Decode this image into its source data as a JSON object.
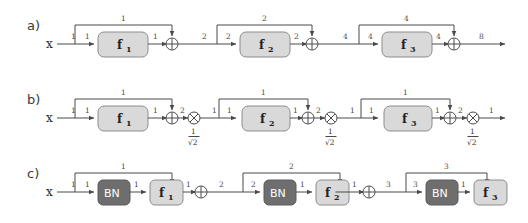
{
  "figure": {
    "background": "#ffffff",
    "colors": {
      "wire": "#4a4a4a",
      "f_block_fill": "#d9d9d9",
      "f_block_stroke": "#8d8d8d",
      "bn_block_fill": "#6e6e6e",
      "bn_block_text": "#ffffff",
      "text": "#333333"
    },
    "rows": [
      {
        "id": "row-a",
        "label": "a)",
        "input_label": "x",
        "description": "plain residual chain, variance doubling",
        "blocks": [
          {
            "name": "f",
            "sub": "1"
          },
          {
            "name": "f",
            "sub": "2"
          },
          {
            "name": "f",
            "sub": "3"
          }
        ],
        "operators": [
          "plus",
          "plus",
          "plus"
        ],
        "edge_labels": {
          "input": "1",
          "stage1": {
            "branch_in": "1",
            "skip": "1",
            "block_out": "1",
            "sum_out": "2"
          },
          "stage2": {
            "branch_in": "2",
            "skip": "2",
            "block_out": "2",
            "sum_out": "4"
          },
          "stage3": {
            "branch_in": "4",
            "skip": "4",
            "block_out": "4",
            "sum_out": "8"
          }
        }
      },
      {
        "id": "row-b",
        "label": "b)",
        "input_label": "x",
        "description": "residual chain with 1/sqrt(2) rescaling after each sum",
        "blocks": [
          {
            "name": "f",
            "sub": "1"
          },
          {
            "name": "f",
            "sub": "2"
          },
          {
            "name": "f",
            "sub": "3"
          }
        ],
        "operators": [
          "plus",
          "times",
          "plus",
          "times",
          "plus",
          "times"
        ],
        "scale_numerator": "1",
        "scale_denominator": "√2",
        "edge_labels": {
          "input": "1",
          "stage1": {
            "branch_in": "1",
            "skip": "1",
            "block_out": "1",
            "sum_out": "2",
            "scaled_out": "1"
          },
          "stage2": {
            "branch_in": "1",
            "skip": "1",
            "block_out": "1",
            "sum_out": "2",
            "scaled_out": "1"
          },
          "stage3": {
            "branch_in": "1",
            "skip": "1",
            "block_out": "1",
            "sum_out": "2",
            "scaled_out": "1"
          }
        }
      },
      {
        "id": "row-c",
        "label": "c)",
        "input_label": "x",
        "description": "pre-activation residual chain with batch normalization",
        "blocks": [
          {
            "norm": "BN",
            "name": "f",
            "sub": "1"
          },
          {
            "norm": "BN",
            "name": "f",
            "sub": "2"
          },
          {
            "norm": "BN",
            "name": "f",
            "sub": "3"
          }
        ],
        "operators": [
          "plus",
          "plus",
          "plus"
        ],
        "edge_labels": {
          "input": "1",
          "stage1": {
            "branch_in": "1",
            "bn_out": "1",
            "skip": "1",
            "block_out": "1",
            "sum_out": "2"
          },
          "stage2": {
            "branch_in": "2",
            "bn_out": "1",
            "skip": "2",
            "block_out": "1",
            "sum_out": "3"
          },
          "stage3": {
            "branch_in": "3",
            "bn_out": "1",
            "skip": "3",
            "block_out": "1",
            "sum_out": "4"
          }
        }
      }
    ]
  }
}
